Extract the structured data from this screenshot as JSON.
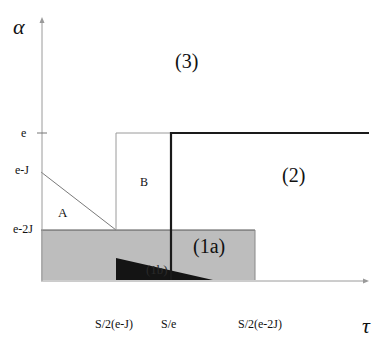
{
  "diagram": {
    "axes": {
      "y_label": "α",
      "x_label": "τ"
    },
    "y_ticks": [
      {
        "label": "e"
      },
      {
        "label": "e-J"
      },
      {
        "label": "e-2J"
      }
    ],
    "x_ticks": [
      {
        "label": "S/2(e-J)"
      },
      {
        "label": "S/e"
      },
      {
        "label": "S/2(e-2J)"
      }
    ],
    "regions": {
      "r3": "(3)",
      "r2": "(2)",
      "r1a": "(1a)",
      "r1b": "(1b)",
      "A": "A",
      "B": "B"
    },
    "colors": {
      "axis": "#9a9a9a",
      "shaded_region": "#bdbdbd",
      "dark_triangle": "#141414",
      "thick_boundary": "#1a1a1a",
      "thin_line": "#7a7a7a"
    }
  }
}
